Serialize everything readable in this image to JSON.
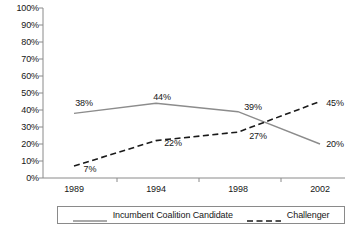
{
  "chart_data": {
    "type": "line",
    "title": "",
    "subtitle": "",
    "xlabel": "",
    "ylabel": "",
    "categories": [
      "1989",
      "1994",
      "1998",
      "2002"
    ],
    "ylim": [
      0,
      100
    ],
    "ytick_labels": [
      "0%",
      "10%",
      "20%",
      "30%",
      "40%",
      "50%",
      "60%",
      "70%",
      "80%",
      "90%",
      "100%"
    ],
    "ytick_values": [
      0,
      10,
      20,
      30,
      40,
      50,
      60,
      70,
      80,
      90,
      100
    ],
    "grid": false,
    "legend_position": "bottom",
    "series": [
      {
        "name": "Incumbent Coalition Candidate",
        "style": "solid",
        "color": "#8c8c8c",
        "values": [
          38,
          44,
          39,
          20
        ],
        "labels": [
          "38%",
          "44%",
          "39%",
          "20%"
        ]
      },
      {
        "name": "Challenger",
        "style": "dashed",
        "color": "#1a1a1a",
        "values": [
          7,
          22,
          27,
          45
        ],
        "labels": [
          "7%",
          "22%",
          "27%",
          "45%"
        ]
      }
    ]
  },
  "axes": {
    "y_ticks": [
      {
        "label": "100%",
        "value": 100
      },
      {
        "label": "90%",
        "value": 90
      },
      {
        "label": "80%",
        "value": 80
      },
      {
        "label": "70%",
        "value": 70
      },
      {
        "label": "60%",
        "value": 60
      },
      {
        "label": "50%",
        "value": 50
      },
      {
        "label": "40%",
        "value": 40
      },
      {
        "label": "30%",
        "value": 30
      },
      {
        "label": "20%",
        "value": 20
      },
      {
        "label": "10%",
        "value": 10
      },
      {
        "label": "0%",
        "value": 0
      }
    ],
    "x_ticks": [
      {
        "label": "1989"
      },
      {
        "label": "1994"
      },
      {
        "label": "1998"
      },
      {
        "label": "2002"
      }
    ]
  },
  "legend": {
    "entries": [
      {
        "label": "Incumbent Coalition Candidate",
        "style": "solid"
      },
      {
        "label": "Challenger",
        "style": "dashed"
      }
    ]
  },
  "point_labels": {
    "incumbent": [
      {
        "text": "38%",
        "x": 84,
        "y": 98
      },
      {
        "text": "44%",
        "x": 162,
        "y": 92
      },
      {
        "text": "39%",
        "x": 253,
        "y": 102
      },
      {
        "text": "20%",
        "x": 335,
        "y": 139
      }
    ],
    "challenger": [
      {
        "text": "7%",
        "x": 90,
        "y": 164
      },
      {
        "text": "22%",
        "x": 173,
        "y": 138
      },
      {
        "text": "27%",
        "x": 258,
        "y": 131
      },
      {
        "text": "45%",
        "x": 335,
        "y": 98
      }
    ]
  },
  "colors": {
    "incumbent_line": "#8c8c8c",
    "challenger_line": "#1a1a1a",
    "axis": "#8a8a8a",
    "text": "#161616",
    "background": "#ffffff"
  }
}
